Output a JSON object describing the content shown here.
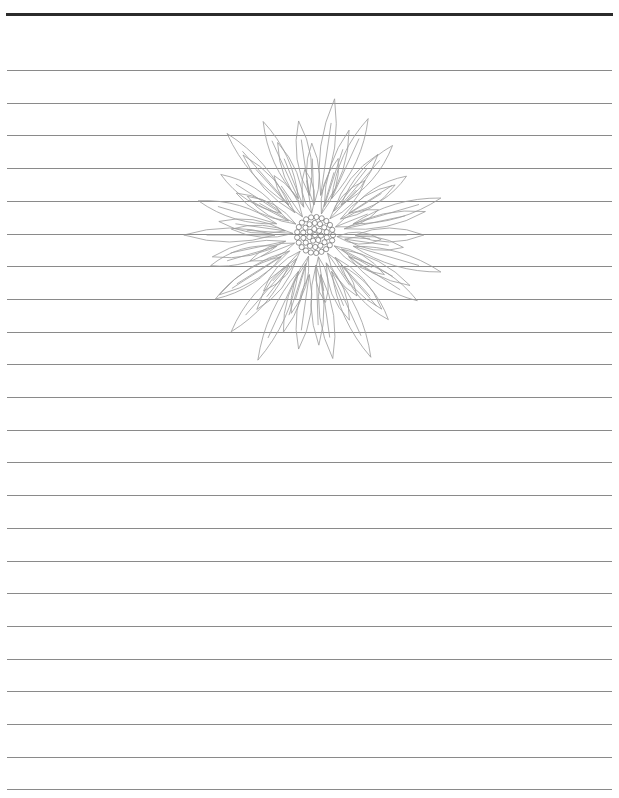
{
  "page": {
    "type": "lined-paper",
    "background": "#ffffff",
    "top_rule_color": "#2b2b2b",
    "rule_color": "#8a8a8a",
    "rule_count": 23,
    "first_rule_y": 70,
    "rule_spacing": 32.7
  },
  "illustration": {
    "subject": "flower-sketch",
    "style": "pencil line drawing",
    "stroke_color": "#9a9a9a"
  }
}
